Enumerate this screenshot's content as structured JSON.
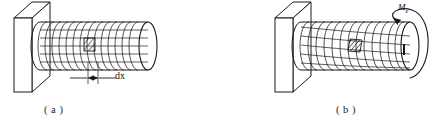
{
  "figure": {
    "stroke_color": "#1a1a1a",
    "fill_color": "#ffffff",
    "panels": [
      {
        "id": "a",
        "caption": "( a )",
        "description": "Undeformed circular shaft built into a wall, surface ruled with a rectangular grid of circumferential rings and longitudinal lines; one small shaded element marked on the surface.",
        "annotations": [
          {
            "name": "dx",
            "text": "dx",
            "kind": "dimension",
            "meaning": "infinitesimal length of shaft element"
          }
        ]
      },
      {
        "id": "b",
        "caption": "( b )",
        "description": "Same shaft twisted by an applied torque; longitudinal lines become helices and the surface element is sheared into a parallelogram.",
        "annotations": [
          {
            "name": "Me",
            "text": "M",
            "subscript": "e",
            "kind": "torque",
            "meaning": "applied external twisting moment at free end"
          }
        ]
      }
    ]
  },
  "geometry": {
    "panel_a": {
      "wall": {
        "front_x": 14,
        "top_y": 18,
        "width": 18,
        "height": 74,
        "depth_x": 18,
        "depth_y": -16
      },
      "shaft": {
        "left_x": 32,
        "right_x": 148,
        "center_y": 46,
        "radius_y": 24,
        "radius_x": 9
      },
      "rings": 15,
      "longitudinal_lines": 5,
      "element": {
        "x": 84,
        "y": 38,
        "w": 11,
        "h": 13
      },
      "dim_line_y": 76,
      "dim_left_x": 88,
      "dim_right_x": 97
    },
    "panel_b": {
      "wall": {
        "front_x": 275,
        "top_y": 18,
        "width": 18,
        "height": 74,
        "depth_x": 18,
        "depth_y": -16
      },
      "shaft": {
        "left_x": 293,
        "right_x": 410,
        "center_y": 46,
        "radius_y": 24,
        "radius_x": 9
      },
      "rings": 13,
      "helix_lines": 5,
      "twist_skew": 14,
      "element": {
        "x": 350,
        "y": 38,
        "w": 12,
        "h": 13
      },
      "torque_arrow": {
        "cx": 410,
        "cy": 45,
        "rx": 11,
        "ry": 26
      }
    }
  }
}
